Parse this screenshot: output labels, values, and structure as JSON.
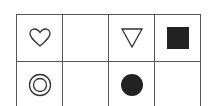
{
  "grid": {
    "rows": 2,
    "columns": 4,
    "cells": [
      {
        "row": 1,
        "col": 1,
        "shape": "heart-outline"
      },
      {
        "row": 1,
        "col": 2,
        "shape": "empty"
      },
      {
        "row": 1,
        "col": 3,
        "shape": "down-triangle-outline"
      },
      {
        "row": 1,
        "col": 4,
        "shape": "filled-square"
      },
      {
        "row": 2,
        "col": 1,
        "shape": "double-circle-outline"
      },
      {
        "row": 2,
        "col": 2,
        "shape": "empty"
      },
      {
        "row": 2,
        "col": 3,
        "shape": "filled-circle"
      },
      {
        "row": 2,
        "col": 4,
        "shape": "empty"
      }
    ],
    "colors": {
      "line": "#555555",
      "fill": "#222222",
      "background": "#ffffff"
    }
  }
}
